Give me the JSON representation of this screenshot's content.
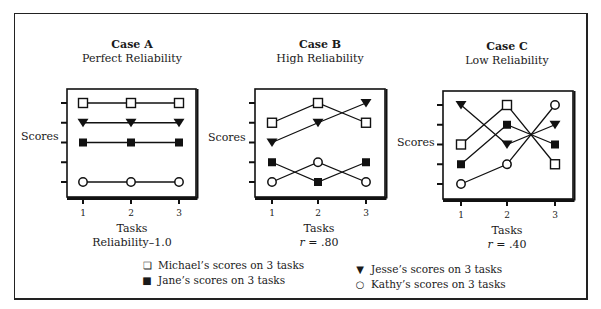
{
  "figure": {
    "ylabel": "Scores",
    "xlabel": "Tasks",
    "panels": [
      {
        "case": "Case A",
        "subtitle": "Perfect Reliability",
        "stat_label": "Reliability–1.0"
      },
      {
        "case": "Case B",
        "subtitle": "High Reliability",
        "stat_prefix": "r",
        "stat_value": " = .80"
      },
      {
        "case": "Case C",
        "subtitle": "Low Reliability",
        "stat_prefix": "r",
        "stat_value": " = .40"
      }
    ],
    "ticks": [
      "1",
      "2",
      "3"
    ]
  },
  "legend": {
    "michael": {
      "glyph": "square-open",
      "label": "Michael’s scores on 3 tasks"
    },
    "jane": {
      "glyph": "square-filled",
      "label": "Jane’s scores on 3 tasks"
    },
    "jesse": {
      "glyph": "triangle-down-filled",
      "label": "Jesse’s scores on 3 tasks"
    },
    "kathy": {
      "glyph": "circle-open",
      "label": "Kathy’s scores on 3 tasks"
    }
  },
  "chart_data": [
    {
      "type": "line",
      "title": "Case A",
      "subtitle": "Perfect Reliability",
      "xlabel": "Tasks",
      "ylabel": "Scores",
      "annotation": "Reliability–1.0",
      "categories": [
        "1",
        "2",
        "3"
      ],
      "ylim": [
        1,
        5
      ],
      "y_ticks_unlabeled": 5,
      "series": [
        {
          "name": "Michael",
          "marker": "open-square",
          "values": [
            5,
            5,
            5
          ]
        },
        {
          "name": "Jesse",
          "marker": "filled-down-triangle",
          "values": [
            4,
            4,
            4
          ]
        },
        {
          "name": "Jane",
          "marker": "filled-square",
          "values": [
            3,
            3,
            3
          ]
        },
        {
          "name": "Kathy",
          "marker": "open-circle",
          "values": [
            1,
            1,
            1
          ]
        }
      ]
    },
    {
      "type": "line",
      "title": "Case B",
      "subtitle": "High Reliability",
      "xlabel": "Tasks",
      "ylabel": "Scores",
      "annotation": "r = .80",
      "categories": [
        "1",
        "2",
        "3"
      ],
      "ylim": [
        1,
        5
      ],
      "y_ticks_unlabeled": 5,
      "series": [
        {
          "name": "Michael",
          "marker": "open-square",
          "values": [
            4,
            5,
            4
          ]
        },
        {
          "name": "Jesse",
          "marker": "filled-down-triangle",
          "values": [
            3,
            4,
            5
          ]
        },
        {
          "name": "Jane",
          "marker": "filled-square",
          "values": [
            2,
            1,
            2
          ]
        },
        {
          "name": "Kathy",
          "marker": "open-circle",
          "values": [
            1,
            2,
            1
          ]
        }
      ]
    },
    {
      "type": "line",
      "title": "Case C",
      "subtitle": "Low Reliability",
      "xlabel": "Tasks",
      "ylabel": "Scores",
      "annotation": "r = .40",
      "categories": [
        "1",
        "2",
        "3"
      ],
      "ylim": [
        1,
        5
      ],
      "y_ticks_unlabeled": 5,
      "series": [
        {
          "name": "Michael",
          "marker": "open-square",
          "values": [
            3,
            5,
            2
          ]
        },
        {
          "name": "Jesse",
          "marker": "filled-down-triangle",
          "values": [
            5,
            3,
            4
          ]
        },
        {
          "name": "Jane",
          "marker": "filled-square",
          "values": [
            2,
            4,
            3
          ]
        },
        {
          "name": "Kathy",
          "marker": "open-circle",
          "values": [
            1,
            2,
            5
          ]
        }
      ]
    }
  ]
}
